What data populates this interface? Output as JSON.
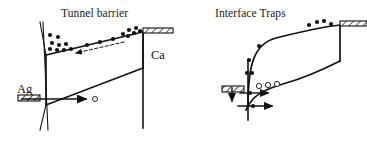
{
  "figure": {
    "background": "#ffffff",
    "ink": "#111111",
    "panels": [
      {
        "id": "tunnel-barrier",
        "title": "Tunnel barrier",
        "title_pos": [
          61,
          7
        ],
        "labels": [
          {
            "name": "ag-electrode-label",
            "text": "Ag",
            "pos": [
              17,
              82
            ]
          },
          {
            "name": "ca-electrode-label",
            "text": "Ca",
            "pos": [
              151,
              48
            ]
          }
        ],
        "band_top": [
          [
            46,
            55
          ],
          [
            143,
            32
          ]
        ],
        "band_bottom": [
          [
            46,
            105
          ],
          [
            143,
            68
          ]
        ],
        "barrier_left": [
          [
            40,
            22
          ],
          [
            46,
            55
          ],
          [
            46,
            105
          ],
          [
            40,
            130
          ]
        ],
        "barrier_spine": [
          [
            43,
            22
          ],
          [
            48,
            130
          ]
        ],
        "ca_contact_vertical": [
          [
            143,
            32
          ],
          [
            143,
            128
          ]
        ],
        "ca_hatch_bar": {
          "x": 143,
          "y": 28,
          "w": 30,
          "h": 5
        },
        "ag_hatch_bar": {
          "x": 18,
          "y": 95,
          "w": 22,
          "h": 6
        },
        "dashed_arrow": {
          "from": [
            124,
            42
          ],
          "to": [
            76,
            53
          ]
        },
        "hole_arrow": {
          "from": [
            22,
            99
          ],
          "to": [
            86,
            99
          ]
        },
        "hole": {
          "cx": 95,
          "cy": 99,
          "r": 2.5
        },
        "electrons": [
          [
            50,
            35
          ],
          [
            58,
            37
          ],
          [
            52,
            43
          ],
          [
            59,
            45
          ],
          [
            66,
            44
          ],
          [
            50,
            49
          ],
          [
            57,
            50
          ],
          [
            64,
            50
          ],
          [
            71,
            49
          ],
          [
            87,
            45
          ],
          [
            100,
            42
          ],
          [
            113,
            39
          ],
          [
            123,
            34
          ],
          [
            129,
            30
          ],
          [
            134,
            33
          ],
          [
            136,
            28
          ],
          [
            140,
            31
          ],
          [
            128,
            36
          ]
        ],
        "electron_r": 2.1
      },
      {
        "id": "interface-traps",
        "title": "Interface Traps",
        "title_pos": [
          215,
          7
        ],
        "labels": [],
        "band_top_curve": "M 248,107 C 248,64 254,44 276,38 C 296,33 320,27 340,25",
        "band_bottom_curve": "M 246,110 C 252,96 262,90 286,83 C 308,77 330,66 340,61",
        "right_contact_vertical": [
          [
            340,
            25
          ],
          [
            340,
            61
          ]
        ],
        "ca_hatch_bar": {
          "x": 340,
          "y": 21,
          "w": 27,
          "h": 5
        },
        "left_hatch_bar": {
          "x": 222,
          "y": 86,
          "w": 22,
          "h": 6
        },
        "vertical_axis": [
          [
            248,
            60
          ],
          [
            248,
            120
          ]
        ],
        "down_arrow": {
          "from": [
            232,
            88
          ],
          "to": [
            232,
            101
          ]
        },
        "right_arrow_upper": {
          "from": [
            240,
            93
          ],
          "to": [
            268,
            93
          ]
        },
        "right_arrow_lower": {
          "from": [
            238,
            106
          ],
          "to": [
            272,
            106
          ]
        },
        "electrons": [
          [
            259,
            46
          ],
          [
            249,
            60
          ],
          [
            247,
            73
          ],
          [
            252,
            73
          ],
          [
            309,
            25
          ],
          [
            317,
            22
          ],
          [
            324,
            21
          ],
          [
            331,
            24
          ]
        ],
        "electron_r": 2.1,
        "holes": [
          {
            "cx": 259,
            "cy": 86,
            "r": 2.6
          },
          {
            "cx": 268,
            "cy": 85,
            "r": 2.6
          },
          {
            "cx": 277,
            "cy": 84,
            "r": 2.6
          }
        ],
        "trap_dots": [
          [
            250,
            93
          ],
          [
            253,
            106
          ]
        ]
      }
    ]
  }
}
